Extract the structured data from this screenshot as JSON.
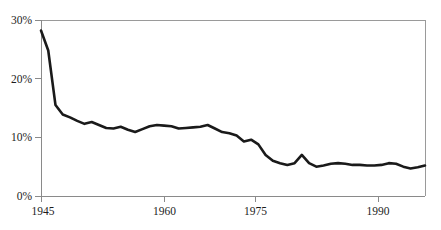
{
  "chart_data": {
    "type": "line",
    "title": "",
    "subtitle": "",
    "xlabel": "",
    "ylabel": "",
    "xlim": [
      1945,
      1998
    ],
    "ylim": [
      0,
      30
    ],
    "grid": false,
    "legend": null,
    "legend_position": "none",
    "y_tick_labels": [
      "0%",
      "10%",
      "20%",
      "30%"
    ],
    "y_tick_values": [
      0,
      10,
      20,
      30
    ],
    "x_tick_labels": [
      "1945",
      "1960",
      "1975",
      "1990"
    ],
    "x_tick_values": [
      1945,
      1960,
      1975,
      1990
    ],
    "series": [
      {
        "name": "series-1",
        "color": "#1a1a1a",
        "x": [
          1945,
          1946,
          1947,
          1948,
          1949,
          1950,
          1951,
          1952,
          1953,
          1954,
          1955,
          1956,
          1957,
          1958,
          1959,
          1960,
          1961,
          1962,
          1963,
          1964,
          1965,
          1966,
          1967,
          1968,
          1969,
          1970,
          1971,
          1972,
          1973,
          1974,
          1975,
          1976,
          1977,
          1978,
          1979,
          1980,
          1981,
          1982,
          1983,
          1984,
          1985,
          1986,
          1987,
          1988,
          1989,
          1990,
          1991,
          1992,
          1993,
          1994,
          1995,
          1996,
          1997,
          1998
        ],
        "values": [
          28.2,
          24.8,
          15.5,
          13.9,
          13.4,
          12.8,
          12.3,
          12.6,
          12.1,
          11.6,
          11.5,
          11.8,
          11.3,
          10.9,
          11.4,
          11.9,
          12.1,
          12.0,
          11.9,
          11.5,
          11.6,
          11.7,
          11.8,
          12.1,
          11.5,
          10.9,
          10.7,
          10.3,
          9.3,
          9.6,
          8.8,
          7.0,
          6.0,
          5.6,
          5.3,
          5.6,
          7.0,
          5.6,
          5.0,
          5.2,
          5.5,
          5.6,
          5.5,
          5.3,
          5.3,
          5.2,
          5.2,
          5.3,
          5.6,
          5.5,
          5.0,
          4.7,
          4.9,
          5.2
        ]
      }
    ]
  },
  "axes": {
    "y_axis_name": "percent-axis",
    "x_axis_name": "year-axis"
  }
}
